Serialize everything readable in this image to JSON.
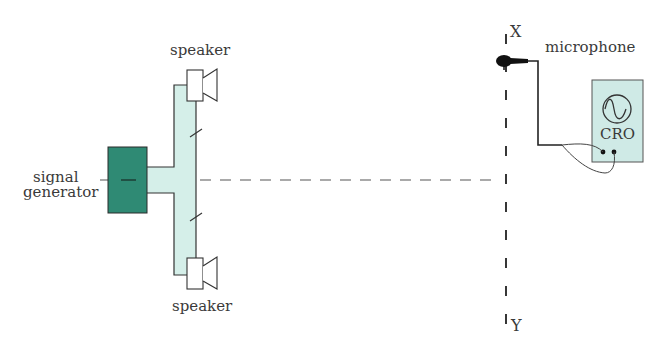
{
  "diagram": {
    "colors": {
      "generator_fill": "#2f8a74",
      "pipe_fill": "#d5efe9",
      "cro_fill": "#cfeae6",
      "line": "#333333"
    },
    "labels": {
      "speaker_top": "speaker",
      "speaker_bottom": "speaker",
      "signal_line1": "signal",
      "signal_line2": "generator",
      "microphone": "microphone",
      "point_x": "X",
      "point_y": "Y",
      "cro": "CRO"
    },
    "icons": {
      "speaker": "speaker-icon",
      "microphone": "microphone-icon",
      "cro_wave": "sine-wave-icon"
    }
  }
}
